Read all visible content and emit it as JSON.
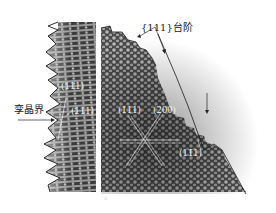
{
  "figure": {
    "type": "HRTEM lattice micrograph",
    "left_panel": {
      "labels": [
        {
          "id": "plane-111-top",
          "text": "(111)"
        },
        {
          "id": "plane-111-bottom",
          "text": "(111)"
        }
      ],
      "annotation": {
        "text": "孪晶界",
        "meaning": "twin boundary"
      }
    },
    "right_panel": {
      "top_annotation": {
        "text": "{111}台阶",
        "meaning": "{111} steps"
      },
      "labels": [
        {
          "id": "plane-111",
          "text": "(111)"
        },
        {
          "id": "plane-200",
          "text": "(200)"
        },
        {
          "id": "plane-11-1",
          "text": "(11̄1)"
        }
      ],
      "corner_mark": "a"
    },
    "colors": {
      "background": "#ffffff",
      "lattice_dark": "#2a2a2a",
      "lattice_mid": "#6e6e6e",
      "lattice_light": "#c8c8c8",
      "outline": "#1a1a1a",
      "label_text": "#f4f4f4"
    }
  }
}
